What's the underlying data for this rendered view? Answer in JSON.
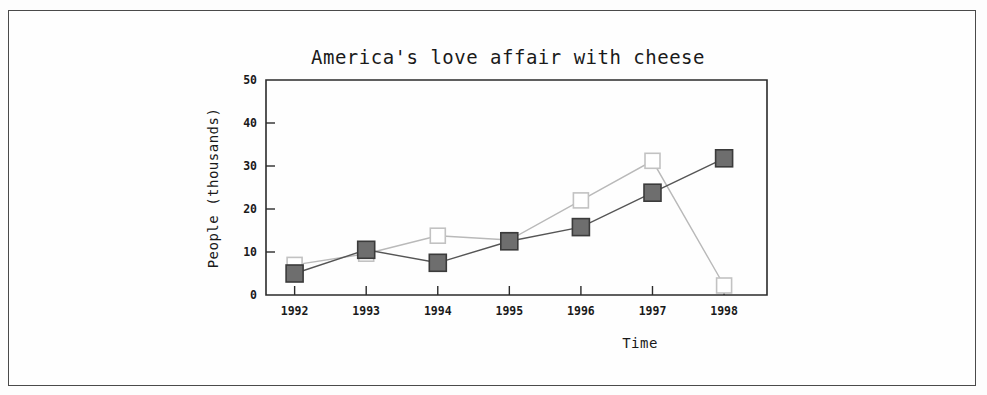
{
  "chart_data": {
    "type": "line",
    "title": "America's love affair with cheese",
    "xlabel": "Time",
    "ylabel": "People (thousands)",
    "categories": [
      "1992",
      "1993",
      "1994",
      "1995",
      "1996",
      "1997",
      "1998"
    ],
    "x": [
      1992,
      1993,
      1994,
      1995,
      1996,
      1997,
      1998
    ],
    "xlim": [
      1991.6,
      1998.6
    ],
    "ylim": [
      0,
      50
    ],
    "yticks": [
      0,
      10,
      20,
      30,
      40,
      50
    ],
    "ytick_labels": [
      "0",
      "10",
      "20",
      "30",
      "40",
      "50"
    ],
    "grid": false,
    "legend": "none",
    "series": [
      {
        "name": "series-filled",
        "marker": "filled-square",
        "color": "#6e6e6e",
        "line_color": "#555555",
        "values": [
          5.0,
          10.5,
          7.5,
          12.5,
          15.8,
          23.8,
          31.8
        ]
      },
      {
        "name": "series-open",
        "marker": "open-square",
        "color": "#ffffff",
        "line_color": "#b9b9b9",
        "values": [
          7.0,
          9.6,
          13.8,
          12.8,
          22.0,
          31.2,
          2.2
        ]
      }
    ]
  },
  "frame": {
    "plot_left": 266,
    "plot_right": 767,
    "plot_top": 80,
    "plot_bottom": 295
  }
}
